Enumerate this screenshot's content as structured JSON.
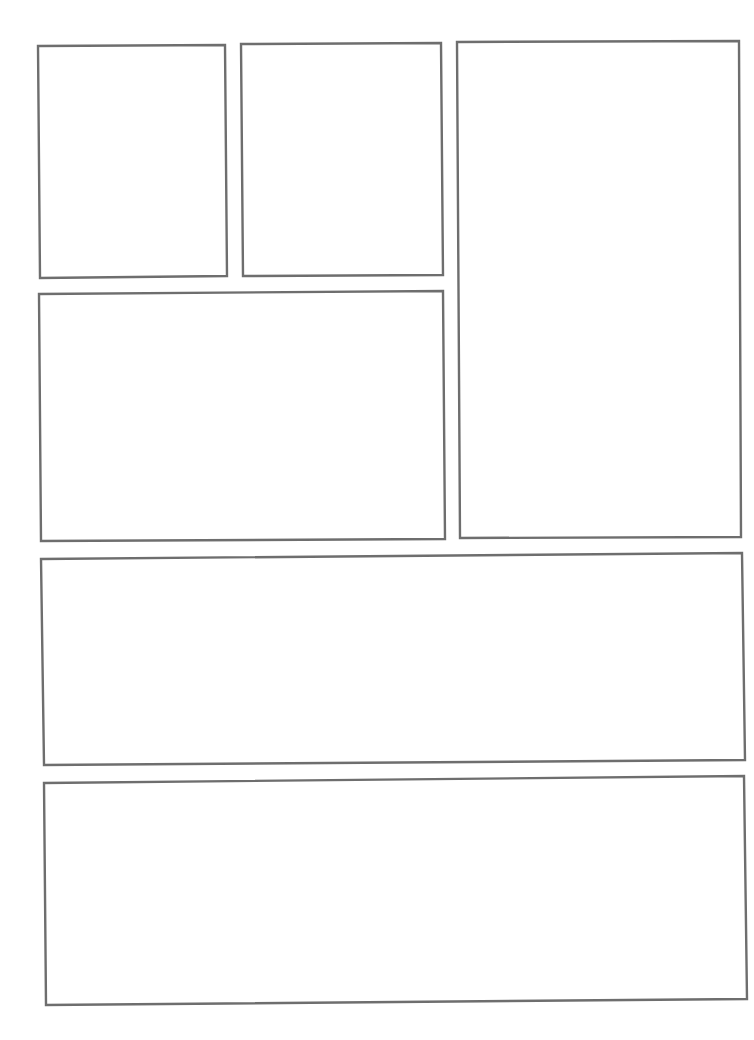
{
  "page": {
    "type": "comic-page-template",
    "background": "#ffffff",
    "border_color": "#6e6e6e",
    "panels": [
      {
        "id": 1,
        "points": "38,46 225,45 227,276 40,278"
      },
      {
        "id": 2,
        "points": "241,44 441,43 443,275 243,276"
      },
      {
        "id": 3,
        "points": "457,42 739,41 741,537 460,538"
      },
      {
        "id": 4,
        "points": "39,294 443,291 445,539 41,541"
      },
      {
        "id": 5,
        "points": "41,559 742,553 745,760 44,765"
      },
      {
        "id": 6,
        "points": "44,783 744,776 747,999 46,1005"
      }
    ]
  }
}
